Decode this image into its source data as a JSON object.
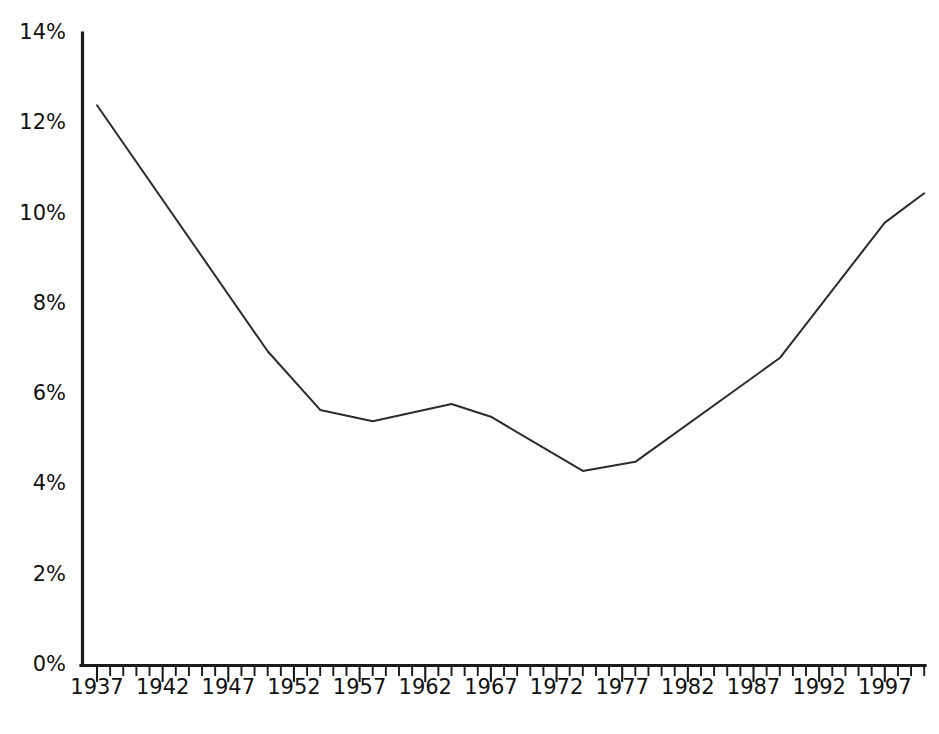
{
  "chart_data": {
    "type": "line",
    "title": "",
    "subtitle": "",
    "xlabel": "",
    "ylabel": "",
    "xlim": [
      1937,
      2000
    ],
    "ylim": [
      0,
      14
    ],
    "grid": false,
    "legend": null,
    "y_tick_labels": [
      "0%",
      "2%",
      "4%",
      "6%",
      "8%",
      "10%",
      "12%",
      "14%"
    ],
    "y_tick_values": [
      0,
      2,
      4,
      6,
      8,
      10,
      12,
      14
    ],
    "x_tick_labels": [
      "1937",
      "1942",
      "1947",
      "1952",
      "1957",
      "1962",
      "1967",
      "1972",
      "1977",
      "1982",
      "1987",
      "1992",
      "1997"
    ],
    "x_tick_values": [
      1937,
      1942,
      1947,
      1952,
      1957,
      1962,
      1967,
      1972,
      1977,
      1982,
      1987,
      1992,
      1997
    ],
    "x_minor_tick_step": 1,
    "series": [
      {
        "name": "",
        "x": [
          1937,
          1950,
          1954,
          1958,
          1964,
          1967,
          1974,
          1978,
          1989,
          1997,
          2000
        ],
        "values": [
          12.4,
          6.95,
          5.65,
          5.4,
          5.78,
          5.5,
          4.3,
          4.5,
          6.8,
          9.8,
          10.45
        ]
      }
    ],
    "annotations": [],
    "colors": {
      "line": "#2b2b2b",
      "axis": "#1a1a1a",
      "background": "#ffffff",
      "tick_label": "#111111"
    }
  }
}
